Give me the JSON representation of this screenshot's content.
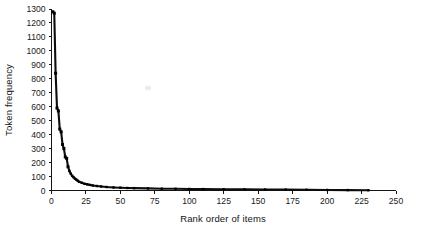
{
  "chart_data": {
    "type": "line",
    "title": "",
    "subtitle": "",
    "xlabel": "Rank order of items",
    "ylabel": "Token frequency",
    "xlim": [
      0,
      250
    ],
    "ylim": [
      0,
      1300
    ],
    "xticks": [
      0,
      25,
      50,
      75,
      100,
      125,
      150,
      175,
      200,
      225,
      250
    ],
    "yticks": [
      0,
      100,
      200,
      300,
      400,
      500,
      600,
      700,
      800,
      900,
      1000,
      1100,
      1200,
      1300
    ],
    "grid": false,
    "legend": false,
    "legend_position": "none",
    "series": [
      {
        "name": "Token frequency by rank",
        "x": [
          1,
          2,
          3,
          4,
          5,
          6,
          7,
          8,
          9,
          10,
          11,
          12,
          13,
          14,
          15,
          16,
          17,
          18,
          19,
          20,
          22,
          24,
          26,
          28,
          30,
          33,
          36,
          40,
          45,
          50,
          55,
          60,
          70,
          80,
          90,
          100,
          110,
          125,
          140,
          155,
          170,
          185,
          200,
          215,
          230
        ],
        "values": [
          1280,
          1270,
          840,
          590,
          570,
          440,
          420,
          330,
          300,
          240,
          230,
          170,
          140,
          120,
          105,
          95,
          85,
          78,
          70,
          62,
          55,
          48,
          44,
          40,
          36,
          32,
          29,
          25,
          22,
          20,
          18,
          17,
          15,
          13,
          12,
          11,
          10,
          9,
          8,
          7,
          6,
          5,
          4,
          3,
          2
        ]
      }
    ],
    "annotations": {
      "max_frequency": 1280,
      "max_rank_plotted": 230,
      "shape": "Zipfian / power-law decay"
    },
    "colors": {
      "curve": "#0d0d0d",
      "axis": "#141414",
      "background": "#ffffff"
    }
  },
  "figure": {
    "axis_title_x": "Rank order of items",
    "axis_title_y": "Token frequency"
  }
}
